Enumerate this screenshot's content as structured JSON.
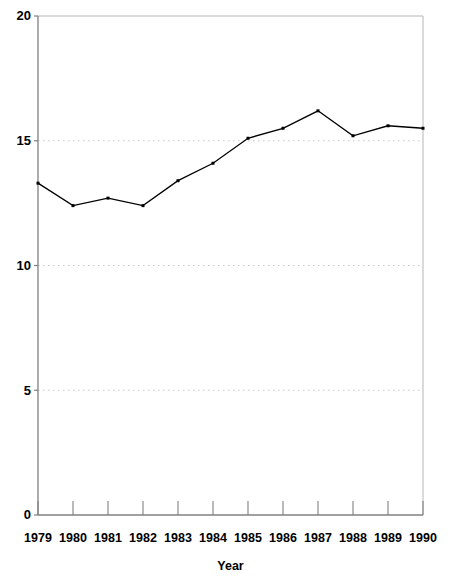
{
  "chart_data": {
    "type": "line",
    "title": "",
    "subtitle": "",
    "xlabel": "Year",
    "ylabel": "",
    "categories": [
      "1979",
      "1980",
      "1981",
      "1982",
      "1983",
      "1984",
      "1985",
      "1986",
      "1987",
      "1988",
      "1989",
      "1990"
    ],
    "x": [
      1979,
      1980,
      1981,
      1982,
      1983,
      1984,
      1985,
      1986,
      1987,
      1988,
      1989,
      1990
    ],
    "values": [
      13.3,
      12.4,
      12.7,
      12.4,
      13.4,
      14.1,
      15.1,
      15.5,
      16.2,
      15.2,
      15.6,
      15.5
    ],
    "series": [
      {
        "name": "",
        "values": [
          13.3,
          12.4,
          12.7,
          12.4,
          13.4,
          14.1,
          15.1,
          15.5,
          16.2,
          15.2,
          15.6,
          15.5
        ]
      }
    ],
    "ylim": [
      0,
      20
    ],
    "xlim": [
      1979,
      1990
    ],
    "yticks": [
      0,
      5,
      10,
      15,
      20
    ],
    "ytick_labels": [
      "0",
      "5",
      "10",
      "15",
      "20"
    ],
    "xtick_labels": [
      "1979",
      "1980",
      "1981",
      "1982",
      "1983",
      "1984",
      "1985",
      "1986",
      "1987",
      "1988",
      "1989",
      "1990"
    ],
    "gridlines": {
      "horizontal_at": [
        5,
        10,
        15
      ],
      "vertical": false,
      "style": "dotted",
      "color": "#c8c8c8"
    },
    "legend": {
      "visible": false,
      "position": "none",
      "entries": []
    },
    "markers": {
      "shape": "square",
      "size": 3,
      "color": "#000000"
    },
    "line": {
      "color": "#000000",
      "width": 1.3
    },
    "colors": {
      "line": "#000000",
      "marker": "#000000",
      "axis": "#808080",
      "grid": "#c8c8c8",
      "text": "#000000",
      "background": "#ffffff"
    }
  }
}
